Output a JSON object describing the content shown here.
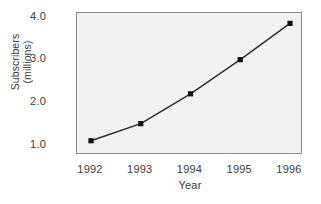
{
  "chart_data": {
    "type": "line",
    "title": "",
    "xlabel": "Year",
    "ylabel": "Subscribers (millions)",
    "ylabel_lines": [
      "Subscribers",
      "(millions)"
    ],
    "categories": [
      "1992",
      "1993",
      "1994",
      "1995",
      "1996"
    ],
    "x": [
      1992,
      1993,
      1994,
      1995,
      1996
    ],
    "values": [
      1.1,
      1.5,
      2.2,
      3.0,
      3.85
    ],
    "series": [
      {
        "name": "Subscribers",
        "values": [
          1.1,
          1.5,
          2.2,
          3.0,
          3.85
        ]
      }
    ],
    "ytick_labels": [
      "1.0",
      "2.0",
      "3.0",
      "4.0"
    ],
    "yticks": [
      1.0,
      2.0,
      3.0,
      4.0
    ],
    "ylim": [
      0.7,
      4.1
    ],
    "xlim": [
      1991.7,
      1996.3
    ],
    "grid": false,
    "legend": false,
    "marker": "square",
    "line_color": "#2b2b2b",
    "marker_color": "#111111",
    "plot_background": "#f2f2f2",
    "frame_color": "#8a8a8a",
    "text_color": "#3b3b3b"
  }
}
